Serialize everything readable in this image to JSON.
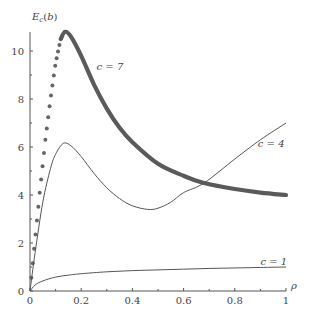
{
  "chart_data": {
    "type": "line",
    "title": "",
    "xlabel": "ρ",
    "ylabel": "E_c(b)",
    "xlim": [
      0,
      1
    ],
    "ylim": [
      0,
      11
    ],
    "grid": false,
    "xticks": [
      "0",
      "0.2",
      "0.4",
      "0.6",
      "0.8",
      "1"
    ],
    "yticks": [
      "0",
      "2",
      "4",
      "6",
      "8",
      "10"
    ],
    "series": [
      {
        "name": "c = 7",
        "style": "thick-dotted-near-origin",
        "x": [
          0,
          0.02,
          0.04,
          0.06,
          0.08,
          0.1,
          0.12,
          0.137,
          0.16,
          0.2,
          0.25,
          0.3,
          0.35,
          0.4,
          0.5,
          0.6,
          0.68,
          0.8,
          0.9,
          1.0
        ],
        "y": [
          0,
          2.2,
          4.3,
          6.3,
          8.0,
          9.5,
          10.5,
          10.8,
          10.6,
          9.8,
          8.6,
          7.6,
          6.8,
          6.2,
          5.3,
          4.8,
          4.5,
          4.25,
          4.1,
          4.0
        ]
      },
      {
        "name": "c = 4",
        "style": "thin",
        "x": [
          0,
          0.02,
          0.05,
          0.08,
          0.1,
          0.13,
          0.16,
          0.2,
          0.25,
          0.3,
          0.35,
          0.4,
          0.46,
          0.5,
          0.55,
          0.6,
          0.68,
          0.8,
          0.9,
          1.0
        ],
        "y": [
          0,
          1.6,
          3.7,
          5.1,
          5.7,
          6.15,
          6.05,
          5.6,
          4.9,
          4.3,
          3.85,
          3.55,
          3.4,
          3.45,
          3.7,
          4.1,
          4.5,
          5.5,
          6.3,
          7.0
        ]
      },
      {
        "name": "c = 1",
        "style": "thin",
        "x": [
          0,
          0.02,
          0.05,
          0.1,
          0.15,
          0.2,
          0.3,
          0.4,
          0.5,
          0.6,
          0.7,
          0.8,
          0.9,
          1.0
        ],
        "y": [
          0,
          0.25,
          0.42,
          0.58,
          0.66,
          0.72,
          0.8,
          0.85,
          0.88,
          0.91,
          0.94,
          0.96,
          0.98,
          1.0
        ]
      }
    ],
    "annotations": [
      {
        "text": "c = 7",
        "x": 0.26,
        "y": 9.2
      },
      {
        "text": "c = 4",
        "x": 0.89,
        "y": 6.0
      },
      {
        "text": "c = 1",
        "x": 0.9,
        "y": 1.1
      }
    ],
    "legend": "none (inline labels)"
  }
}
